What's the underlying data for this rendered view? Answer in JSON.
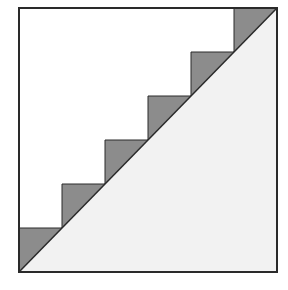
{
  "diagram": {
    "description": "Staircase approximation of a diagonal inside a square",
    "colors": {
      "background": "#ffffff",
      "outline": "#2a2a2a",
      "step_fill": "#8c8c8c",
      "triangle_fill": "#f2f2f2"
    },
    "square": {
      "x": 19,
      "y": 8,
      "width": 258,
      "height": 264
    },
    "diagonal": {
      "x1": 19,
      "y1": 272,
      "x2": 277,
      "y2": 8
    },
    "step_count": 6,
    "steps": [
      {
        "x": 19,
        "top": 228,
        "width": 43
      },
      {
        "x": 62,
        "top": 184,
        "width": 43
      },
      {
        "x": 105,
        "top": 140,
        "width": 43
      },
      {
        "x": 148,
        "top": 96,
        "width": 43
      },
      {
        "x": 191,
        "top": 52,
        "width": 43
      },
      {
        "x": 234,
        "top": 8,
        "width": 43
      }
    ]
  }
}
